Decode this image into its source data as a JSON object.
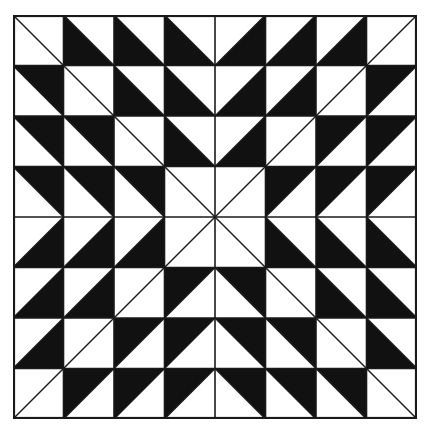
{
  "figure": {
    "type": "half-square-triangle quilt pattern",
    "grid": {
      "rows": 8,
      "cols": 8
    },
    "colors": {
      "fill": "#111111",
      "background": "#ffffff",
      "line": "#1a1a1a"
    },
    "legend_for_cells": {
      "d": "diagonal direction: '\\\\' = top-left to bottom-right, '/' = bottom-left to top-right",
      "b": "black half: UR / LL for '\\\\' diagonals, UL / LR for '/' diagonals, '-' = no black"
    },
    "cells": [
      [
        [
          "\\",
          "-"
        ],
        [
          "\\",
          "LL"
        ],
        [
          "\\",
          "LL"
        ],
        [
          "\\",
          "LL"
        ],
        [
          "/",
          "LR"
        ],
        [
          "/",
          "LR"
        ],
        [
          "/",
          "LR"
        ],
        [
          "/",
          "-"
        ]
      ],
      [
        [
          "\\",
          "UR"
        ],
        [
          "\\",
          "-"
        ],
        [
          "\\",
          "LL"
        ],
        [
          "\\",
          "LL"
        ],
        [
          "/",
          "LR"
        ],
        [
          "/",
          "LR"
        ],
        [
          "/",
          "-"
        ],
        [
          "/",
          "UL"
        ]
      ],
      [
        [
          "\\",
          "UR"
        ],
        [
          "\\",
          "UR"
        ],
        [
          "\\",
          "-"
        ],
        [
          "\\",
          "LL"
        ],
        [
          "/",
          "LR"
        ],
        [
          "/",
          "-"
        ],
        [
          "/",
          "UL"
        ],
        [
          "/",
          "UL"
        ]
      ],
      [
        [
          "\\",
          "UR"
        ],
        [
          "\\",
          "UR"
        ],
        [
          "\\",
          "UR"
        ],
        [
          "\\",
          "-"
        ],
        [
          "/",
          "-"
        ],
        [
          "/",
          "UL"
        ],
        [
          "/",
          "UL"
        ],
        [
          "/",
          "UL"
        ]
      ],
      [
        [
          "/",
          "LR"
        ],
        [
          "/",
          "LR"
        ],
        [
          "/",
          "LR"
        ],
        [
          "/",
          "-"
        ],
        [
          "\\",
          "-"
        ],
        [
          "\\",
          "LL"
        ],
        [
          "\\",
          "LL"
        ],
        [
          "\\",
          "LL"
        ]
      ],
      [
        [
          "/",
          "LR"
        ],
        [
          "/",
          "LR"
        ],
        [
          "/",
          "-"
        ],
        [
          "/",
          "UL"
        ],
        [
          "\\",
          "UR"
        ],
        [
          "\\",
          "-"
        ],
        [
          "\\",
          "LL"
        ],
        [
          "\\",
          "LL"
        ]
      ],
      [
        [
          "/",
          "LR"
        ],
        [
          "/",
          "-"
        ],
        [
          "/",
          "UL"
        ],
        [
          "/",
          "UL"
        ],
        [
          "\\",
          "UR"
        ],
        [
          "\\",
          "UR"
        ],
        [
          "\\",
          "-"
        ],
        [
          "\\",
          "LL"
        ]
      ],
      [
        [
          "/",
          "-"
        ],
        [
          "/",
          "UL"
        ],
        [
          "/",
          "UL"
        ],
        [
          "/",
          "UL"
        ],
        [
          "\\",
          "UR"
        ],
        [
          "\\",
          "UR"
        ],
        [
          "\\",
          "UR"
        ],
        [
          "\\",
          "-"
        ]
      ]
    ]
  }
}
